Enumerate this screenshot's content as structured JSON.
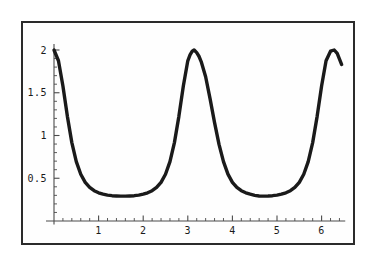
{
  "chart_data": {
    "type": "line",
    "title": "",
    "subtitle": "",
    "xlabel": "",
    "ylabel": "",
    "xlim": [
      -0.12,
      6.55
    ],
    "ylim": [
      -0.12,
      2.12
    ],
    "grid": false,
    "legend": null,
    "line_color": "#1a1a1a",
    "line_width": 3.4,
    "axis_color": "#4a4a4a",
    "frame_color": "#2b2b2b",
    "background": "#ffffff",
    "x_ticks_major": [
      1,
      2,
      3,
      4,
      5,
      6
    ],
    "x_tick_labels": [
      "1",
      "2",
      "3",
      "4",
      "5",
      "6"
    ],
    "x_ticks_minor_step": 0.2,
    "y_ticks_major": [
      0.5,
      1,
      1.5,
      2
    ],
    "y_tick_labels": [
      "0.5",
      "1",
      "1.5",
      "2"
    ],
    "y_ticks_minor_step": 0.1,
    "x_axis_start": 0,
    "x_axis_end": 6.45,
    "y_axis_start": 0,
    "y_axis_end": 2.05,
    "series": [
      {
        "name": "curve",
        "formula_description": "periodic curve with maxima of 2 at x = 0, pi, 2pi and minima of about 0.25 at x = pi/2 and 3pi/2",
        "x": [
          0.0,
          0.1,
          0.2,
          0.3,
          0.4,
          0.5,
          0.6,
          0.7,
          0.8,
          0.9,
          1.0,
          1.1,
          1.2,
          1.3,
          1.4,
          1.5,
          1.5708,
          1.6,
          1.7,
          1.8,
          1.9,
          2.0,
          2.1,
          2.2,
          2.3,
          2.4,
          2.5,
          2.6,
          2.7,
          2.8,
          2.9,
          3.0,
          3.05,
          3.1,
          3.1416,
          3.2,
          3.25,
          3.3,
          3.4,
          3.5,
          3.6,
          3.7,
          3.8,
          3.9,
          4.0,
          4.1,
          4.2,
          4.3,
          4.4,
          4.5,
          4.6,
          4.7124,
          4.8,
          4.9,
          5.0,
          5.1,
          5.2,
          5.3,
          5.4,
          5.5,
          5.6,
          5.7,
          5.8,
          5.9,
          6.0,
          6.1,
          6.2,
          6.2832,
          6.35,
          6.45
        ],
        "y": [
          2.0,
          1.874,
          1.579,
          1.224,
          0.917,
          0.695,
          0.547,
          0.452,
          0.392,
          0.354,
          0.33,
          0.314,
          0.303,
          0.296,
          0.293,
          0.291,
          0.291,
          0.291,
          0.293,
          0.296,
          0.303,
          0.314,
          0.33,
          0.354,
          0.392,
          0.452,
          0.547,
          0.695,
          0.917,
          1.224,
          1.579,
          1.874,
          1.942,
          1.986,
          2.0,
          1.969,
          1.927,
          1.865,
          1.687,
          1.428,
          1.15,
          0.896,
          0.695,
          0.548,
          0.452,
          0.392,
          0.354,
          0.33,
          0.314,
          0.3,
          0.293,
          0.291,
          0.292,
          0.296,
          0.303,
          0.314,
          0.33,
          0.354,
          0.392,
          0.452,
          0.547,
          0.695,
          0.917,
          1.224,
          1.579,
          1.874,
          1.986,
          2.0,
          1.96,
          1.83
        ]
      }
    ]
  },
  "figure": {
    "caption": "",
    "frame": true
  }
}
